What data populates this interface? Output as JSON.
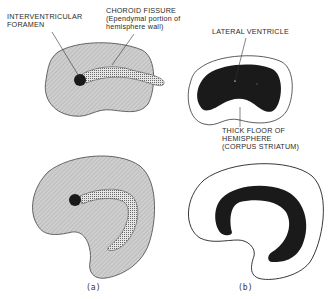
{
  "diagram": {
    "panels": [
      {
        "id": "a",
        "caption": "(a)"
      },
      {
        "id": "b",
        "caption": "(b)"
      }
    ],
    "labels": {
      "interventricular_foramen": [
        "INTERVENTRICULAR",
        "FORAMEN"
      ],
      "choroid_fissure": [
        "CHOROID FISSURE",
        "(Ependymal portion of",
        "hemisphere wall)"
      ],
      "lateral_ventricle": [
        "LATERAL VENTRICLE"
      ],
      "thick_floor": [
        "THICK FLOOR OF",
        "HEMISPHERE",
        "(CORPUS STRIATUM)"
      ]
    },
    "colors": {
      "hemisphere_fill": "#c8c8c8",
      "outline": "#333333",
      "ventricle_fill": "#1a1a1a",
      "fissure_fill": "#9a9a9a",
      "background": "#ffffff"
    }
  }
}
